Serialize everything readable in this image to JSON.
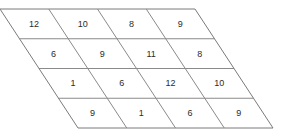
{
  "figure": {
    "background_color": "#ffffff",
    "line_color": "#8a8a8a",
    "text_color": "#2b2b2b",
    "rows": 4,
    "columns": 4,
    "geometry": {
      "top_y": 9,
      "bottom_y": 128,
      "row_height": 29.75,
      "cell_width": 48.75,
      "row_shift_x": 19.5,
      "top_left_x": 0,
      "top_right_x": 195,
      "bottom_left_x": 78,
      "bottom_right_x": 265
    },
    "grid": [
      {
        "row_index": 0,
        "cells": [
          {
            "col_index": 0,
            "value": "12"
          },
          {
            "col_index": 1,
            "value": "10"
          },
          {
            "col_index": 2,
            "value": "8"
          },
          {
            "col_index": 3,
            "value": "9"
          }
        ]
      },
      {
        "row_index": 1,
        "cells": [
          {
            "col_index": 0,
            "value": "6"
          },
          {
            "col_index": 1,
            "value": "9"
          },
          {
            "col_index": 2,
            "value": "11"
          },
          {
            "col_index": 3,
            "value": "8"
          }
        ]
      },
      {
        "row_index": 2,
        "cells": [
          {
            "col_index": 0,
            "value": "1"
          },
          {
            "col_index": 1,
            "value": "6"
          },
          {
            "col_index": 2,
            "value": "12"
          },
          {
            "col_index": 3,
            "value": "10"
          }
        ]
      },
      {
        "row_index": 3,
        "cells": [
          {
            "col_index": 0,
            "value": "9"
          },
          {
            "col_index": 1,
            "value": "1"
          },
          {
            "col_index": 2,
            "value": "6"
          },
          {
            "col_index": 3,
            "value": "9"
          }
        ]
      }
    ]
  }
}
